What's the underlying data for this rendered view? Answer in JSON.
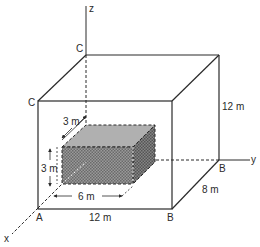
{
  "figure": {
    "type": "3d-isometric-box-diagram",
    "colors": {
      "line": "#2a2a2a",
      "inner_front": "#8a8a8a",
      "inner_top": "#b4b4b4",
      "inner_side": "#6e6e6e",
      "background": "#ffffff"
    }
  },
  "axes": {
    "x": "x",
    "y": "y",
    "z": "z"
  },
  "vertices": {
    "a": "A",
    "b_front": "B",
    "b_back": "B",
    "c_front": "C",
    "c_back": "C"
  },
  "outer_box": {
    "width_label": "12 m",
    "height_label": "12 m",
    "depth_label": "8 m"
  },
  "inner_box": {
    "length_label": "6 m",
    "height_label": "3 m",
    "depth_label": "3 m"
  }
}
